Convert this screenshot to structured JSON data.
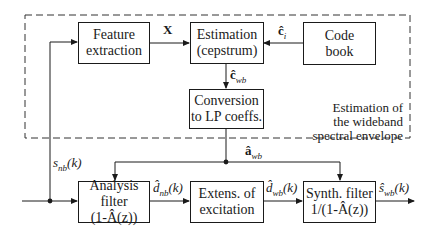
{
  "diagram": {
    "type": "block-diagram",
    "region": {
      "label_lines": [
        "Estimation of",
        "the wideband",
        "spectral envelope"
      ],
      "style": "dashed"
    },
    "blocks": [
      {
        "id": "feature",
        "lines": [
          "Feature",
          "extraction"
        ]
      },
      {
        "id": "estimation",
        "lines": [
          "Estimation",
          "(cepstrum)"
        ]
      },
      {
        "id": "codebook",
        "lines": [
          "Code",
          "book"
        ]
      },
      {
        "id": "conversion",
        "lines": [
          "Conversion",
          "to LP coeffs."
        ]
      },
      {
        "id": "analysis",
        "lines": [
          "Analysis filter",
          "(1-Â(z))"
        ]
      },
      {
        "id": "extension",
        "lines": [
          "Extens. of",
          "excitation"
        ]
      },
      {
        "id": "synth",
        "lines": [
          "Synth. filter",
          "1/(1-Â(z))"
        ]
      }
    ],
    "signals": {
      "x": "X",
      "c_i": "ĉ",
      "c_i_sub": "i",
      "c_wb": "ĉ",
      "c_wb_sub": "wb",
      "a_wb": "â",
      "a_wb_sub": "wb",
      "s_nb": "s",
      "s_nb_sub": "nb",
      "s_nb_arg": "(k)",
      "d_nb": "d̂",
      "d_nb_sub": "nb",
      "d_nb_arg": "(k)",
      "d_wb": "d̂",
      "d_wb_sub": "wb",
      "d_wb_arg": "(k)",
      "s_wb": "ŝ",
      "s_wb_sub": "wb",
      "s_wb_arg": "(k)"
    },
    "connections": [
      {
        "from": "input",
        "to": "analysis",
        "label": "s_nb(k)"
      },
      {
        "from": "input",
        "to": "feature"
      },
      {
        "from": "feature",
        "to": "estimation",
        "label": "X"
      },
      {
        "from": "codebook",
        "to": "estimation",
        "label": "ĉ_i"
      },
      {
        "from": "estimation",
        "to": "conversion",
        "label": "ĉ_wb"
      },
      {
        "from": "conversion",
        "to": "analysis",
        "label": "â_wb"
      },
      {
        "from": "conversion",
        "to": "synth",
        "label": "â_wb"
      },
      {
        "from": "analysis",
        "to": "extension",
        "label": "d̂_nb(k)"
      },
      {
        "from": "extension",
        "to": "synth",
        "label": "d̂_wb(k)"
      },
      {
        "from": "synth",
        "to": "output",
        "label": "ŝ_wb(k)"
      }
    ]
  }
}
